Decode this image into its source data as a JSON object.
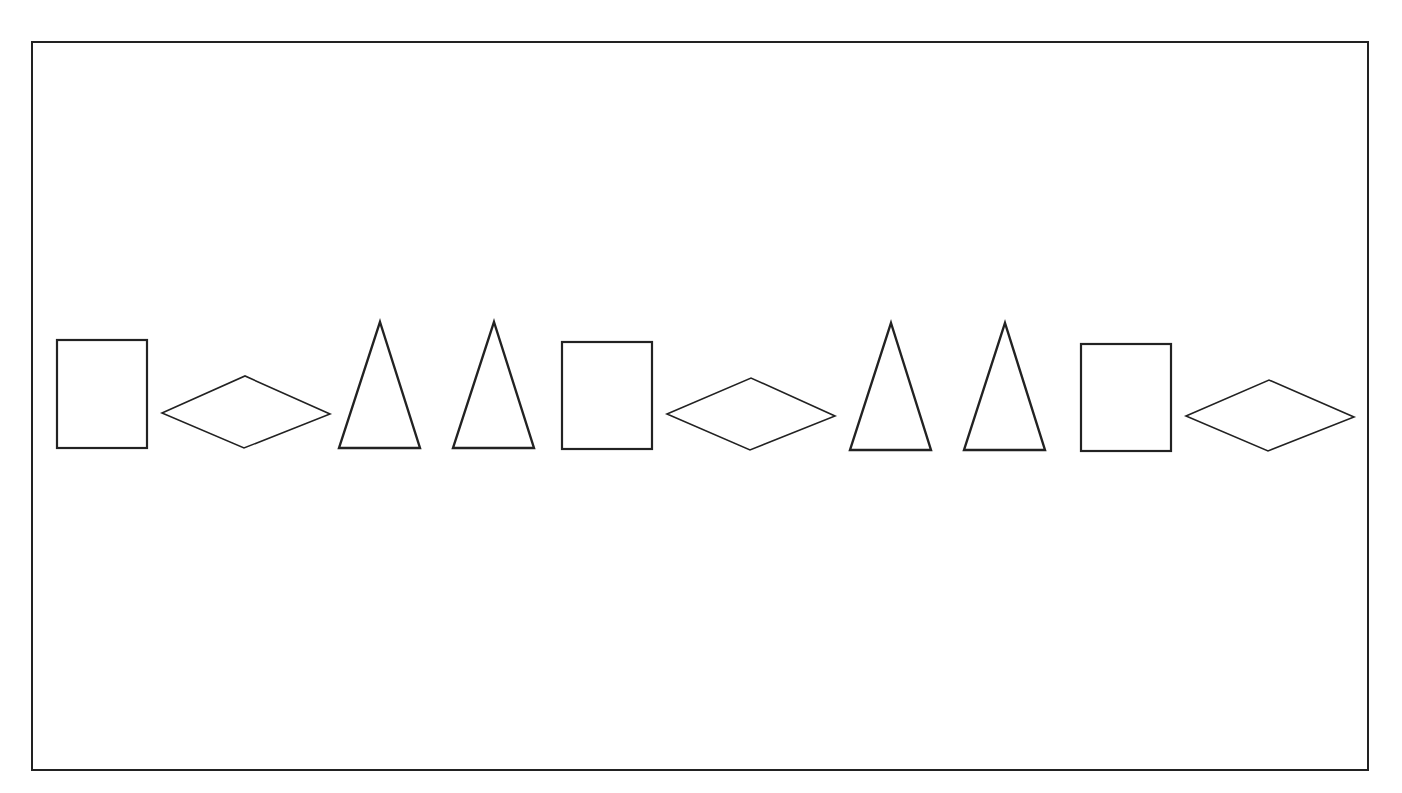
{
  "figure": {
    "frame": {
      "stroke": "#222222"
    },
    "shape_stroke": "#222222",
    "sequence": [
      "rectangle",
      "diamond",
      "triangle",
      "triangle",
      "rectangle",
      "diamond",
      "triangle",
      "triangle",
      "rectangle",
      "diamond"
    ],
    "shapes": [
      {
        "type": "rectangle",
        "x": 57,
        "y": 340,
        "w": 90,
        "h": 108
      },
      {
        "type": "diamond",
        "points": "162,413 245,376 330,414 244,448"
      },
      {
        "type": "triangle",
        "points": "380,322 420,448 339,448"
      },
      {
        "type": "triangle",
        "points": "494,322 534,448 453,448"
      },
      {
        "type": "rectangle",
        "x": 562,
        "y": 342,
        "w": 90,
        "h": 107
      },
      {
        "type": "diamond",
        "points": "667,414 751,378 835,416 750,450"
      },
      {
        "type": "triangle",
        "points": "891,323 931,450 850,450"
      },
      {
        "type": "triangle",
        "points": "1005,323 1045,450 964,450"
      },
      {
        "type": "rectangle",
        "x": 1081,
        "y": 344,
        "w": 90,
        "h": 107
      },
      {
        "type": "diamond",
        "points": "1186,416 1269,380 1354,417 1268,451"
      }
    ]
  },
  "caption": {
    "text": ""
  }
}
